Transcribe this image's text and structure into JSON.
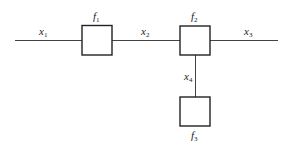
{
  "diagram": {
    "type": "factor-graph",
    "variables": [
      {
        "id": "x1",
        "name": "x",
        "sub": "1"
      },
      {
        "id": "x2",
        "name": "x",
        "sub": "2"
      },
      {
        "id": "x3",
        "name": "x",
        "sub": "3"
      },
      {
        "id": "x4",
        "name": "x",
        "sub": "4"
      }
    ],
    "factors": [
      {
        "id": "f1",
        "name": "f",
        "sub": "1"
      },
      {
        "id": "f2",
        "name": "f",
        "sub": "2"
      },
      {
        "id": "f3",
        "name": "f",
        "sub": "3"
      }
    ],
    "edges": [
      [
        "x1",
        "f1"
      ],
      [
        "f1",
        "x2"
      ],
      [
        "x2",
        "f2"
      ],
      [
        "f2",
        "x3"
      ],
      [
        "f2",
        "x4"
      ],
      [
        "x4",
        "f3"
      ]
    ],
    "colors": {
      "stroke": "#333333",
      "background": "#ffffff"
    }
  }
}
